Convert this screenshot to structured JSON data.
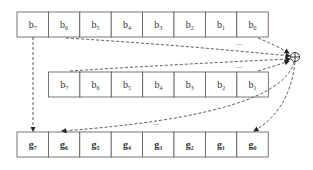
{
  "diagram": {
    "rows": [
      {
        "id": "input-bits",
        "prefix": "b",
        "subscripts": [
          "7",
          "6",
          "5",
          "4",
          "3",
          "2",
          "1",
          "0"
        ]
      },
      {
        "id": "shifted-bits",
        "prefix": "b",
        "subscripts": [
          "7",
          "6",
          "5",
          "4",
          "3",
          "2",
          "1"
        ]
      },
      {
        "id": "gray-bits",
        "prefix": "g",
        "subscripts": [
          "7",
          "6",
          "5",
          "4",
          "3",
          "2",
          "1",
          "0"
        ]
      }
    ],
    "operator": "⊕",
    "ellipsis": "..."
  }
}
